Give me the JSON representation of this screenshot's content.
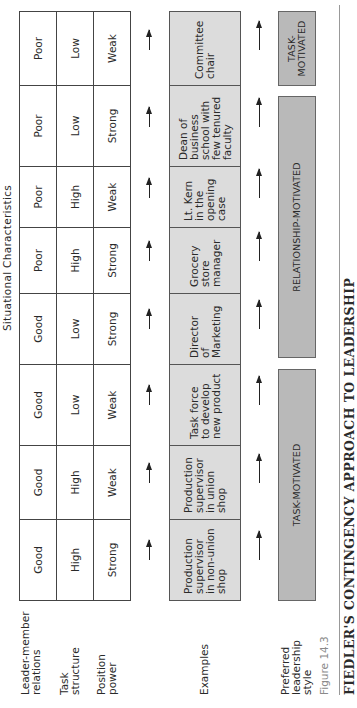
{
  "figure": {
    "header": "Situational Characteristics",
    "row_labels": {
      "leader_member": "Leader-member\nrelations",
      "task_structure": "Task\nstructure",
      "position_power": "Position\npower",
      "examples": "Examples",
      "preferred_style": "Preferred\nleadership\nstyle"
    },
    "situations": [
      {
        "leader_member": "Good",
        "task_structure": "High",
        "position_power": "Strong",
        "example": "Production\nsupervisor\nin non-union\nshop"
      },
      {
        "leader_member": "Good",
        "task_structure": "High",
        "position_power": "Weak",
        "example": "Production\nsupervisor\nin union\nshop"
      },
      {
        "leader_member": "Good",
        "task_structure": "Low",
        "position_power": "Weak",
        "example": "Task force\nto develop\nnew product"
      },
      {
        "leader_member": "Good",
        "task_structure": "Low",
        "position_power": "Strong",
        "example": "Director\nof\nMarketing"
      },
      {
        "leader_member": "Poor",
        "task_structure": "High",
        "position_power": "Strong",
        "example": "Grocery\nstore\nmanager"
      },
      {
        "leader_member": "Poor",
        "task_structure": "High",
        "position_power": "Weak",
        "example": "Lt. Kern\nin the\nopening\ncase"
      },
      {
        "leader_member": "Poor",
        "task_structure": "Low",
        "position_power": "Strong",
        "example": "Dean of\nbusiness\nschool with\nfew tenured\nfaculty"
      },
      {
        "leader_member": "Poor",
        "task_structure": "Low",
        "position_power": "Weak",
        "example": "Committee\nchair"
      }
    ],
    "styles": [
      {
        "label": "TASK-MOTIVATED",
        "span": [
          1,
          4
        ]
      },
      {
        "label": "RELATIONSHIP-MOTIVATED",
        "span": [
          4,
          7
        ]
      },
      {
        "label": "TASK-\nMOTIVATED",
        "span": [
          8,
          8
        ]
      }
    ],
    "caption_number": "Figure 14.3",
    "caption_title": "FIEDLER'S CONTINGENCY APPROACH TO LEADERSHIP",
    "colors": {
      "example_fill": "#dcdcdc",
      "style_fill": "#b9b9b9",
      "caption_number": "#8a8a8a"
    }
  }
}
